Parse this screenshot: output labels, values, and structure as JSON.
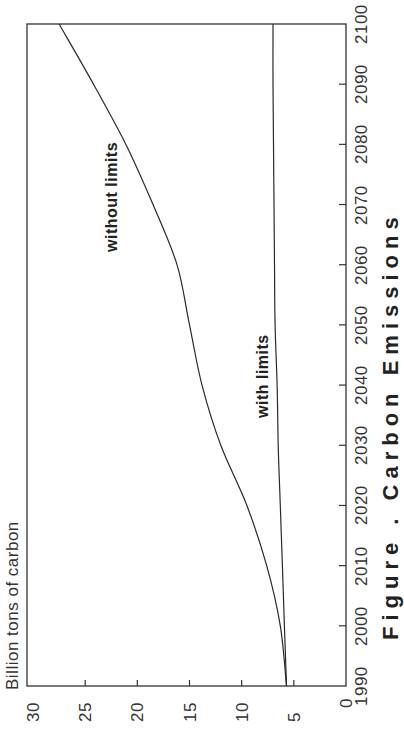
{
  "chart_data": {
    "type": "line",
    "title": "",
    "orientation": "rotated-90-ccw",
    "xlabel": "",
    "ylabel": "Billion tons of carbon",
    "x": [
      1990,
      2000,
      2010,
      2020,
      2030,
      2040,
      2050,
      2060,
      2070,
      2080,
      2090,
      2100
    ],
    "xlim": [
      1990,
      2100
    ],
    "ylim": [
      0,
      30
    ],
    "x_ticks": [
      "1990",
      "2000",
      "2010",
      "2020",
      "2030",
      "2040",
      "2050",
      "2060",
      "2070",
      "2080",
      "2090",
      "2100"
    ],
    "y_ticks": [
      "0",
      "5",
      "10",
      "15",
      "20",
      "25",
      "30"
    ],
    "grid": false,
    "legend": "none (inline labels)",
    "series": [
      {
        "name": "without limits",
        "values": [
          5.7,
          6.3,
          7.6,
          9.5,
          12.0,
          13.8,
          15.0,
          16.2,
          18.5,
          21.1,
          24.2,
          27.5
        ]
      },
      {
        "name": "with limits",
        "values": [
          5.7,
          5.9,
          6.1,
          6.3,
          6.5,
          6.6,
          6.8,
          6.85,
          6.9,
          6.95,
          7.0,
          7.0
        ]
      }
    ],
    "annotations": [
      "without limits",
      "with limits"
    ],
    "caption": "Figure . Carbon Emissions"
  },
  "labels": {
    "ylabel": "Billion tons of carbon",
    "without": "without limits",
    "with": "with limits",
    "caption": "Figure . Carbon Emissions"
  },
  "colors": {
    "line": "#2a2a2a",
    "axis": "#333333",
    "background": "#ffffff"
  }
}
